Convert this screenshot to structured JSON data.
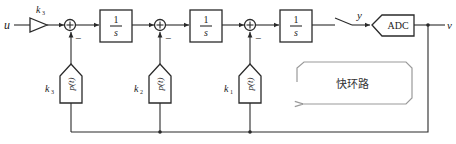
{
  "diagram": {
    "input_label": "u",
    "output_label": "v",
    "gain_input": {
      "label": "k",
      "sub": "3"
    },
    "integrators": [
      {
        "num": "1",
        "den": "s"
      },
      {
        "num": "1",
        "den": "s"
      },
      {
        "num": "1",
        "den": "s"
      }
    ],
    "summers": [
      {
        "sign": "−"
      },
      {
        "sign": "−"
      },
      {
        "sign": "−"
      }
    ],
    "feedback_blocks": [
      {
        "gain": "k",
        "sub": "3",
        "label": "p(t)"
      },
      {
        "gain": "k",
        "sub": "2",
        "label": "p(t)"
      },
      {
        "gain": "k",
        "sub": "1",
        "label": "p(t)"
      }
    ],
    "switch_output_label": "y",
    "adc_label": "ADC",
    "loop_annotation": "快环路"
  }
}
